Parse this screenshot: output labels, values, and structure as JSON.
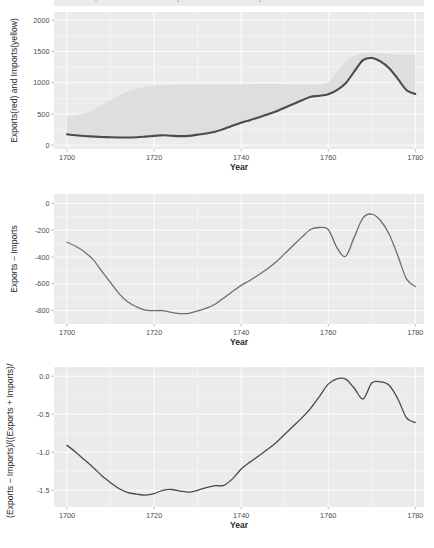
{
  "figure": {
    "width": 434,
    "height": 548,
    "background": "#ffffff",
    "panel_background": "#ebebeb",
    "gridline_color": "#ffffff",
    "tick_color": "#9a9a9a",
    "axis_text_color": "#4d4d4d",
    "axis_title_color": "#2b2b2b"
  },
  "shared": {
    "xlabel": "Year",
    "x_ticks": [
      1700,
      1720,
      1740,
      1760,
      1780
    ],
    "x_tick_labels": [
      "1700",
      "1720",
      "1740",
      "1760",
      "1780"
    ],
    "xlim": [
      1697,
      1782
    ]
  },
  "chart_data": [
    {
      "id": "panel-exports-imports-levels",
      "type": "area",
      "title": "",
      "xlabel": "Year",
      "ylabel": "Exports(red) and Imports(yellow)",
      "xlim": [
        1697,
        1782
      ],
      "ylim": [
        -60,
        2130
      ],
      "y_ticks": [
        0,
        500,
        1000,
        1500,
        2000
      ],
      "y_tick_labels": [
        "0",
        "500",
        "1000",
        "1500",
        "2000"
      ],
      "grid": true,
      "legend_position": "none",
      "x": [
        1700,
        1702,
        1704,
        1706,
        1708,
        1710,
        1712,
        1714,
        1716,
        1718,
        1720,
        1722,
        1724,
        1726,
        1728,
        1730,
        1732,
        1734,
        1736,
        1738,
        1740,
        1742,
        1744,
        1746,
        1748,
        1750,
        1752,
        1754,
        1756,
        1758,
        1760,
        1762,
        1764,
        1766,
        1768,
        1770,
        1772,
        1774,
        1776,
        1778,
        1780
      ],
      "series": [
        {
          "name": "Exports(red)",
          "color": "#4a4a4a",
          "values": [
            175,
            160,
            148,
            140,
            133,
            128,
            125,
            124,
            128,
            138,
            150,
            160,
            152,
            146,
            150,
            170,
            188,
            215,
            260,
            310,
            360,
            400,
            445,
            490,
            540,
            600,
            660,
            720,
            775,
            790,
            815,
            880,
            990,
            1180,
            1360,
            1395,
            1340,
            1230,
            1060,
            880,
            820
          ]
        },
        {
          "name": "Imports(yellow)",
          "color": "#dedede",
          "values": [
            465,
            480,
            510,
            560,
            640,
            720,
            800,
            860,
            900,
            935,
            950,
            960,
            965,
            968,
            970,
            972,
            970,
            968,
            966,
            968,
            972,
            975,
            978,
            980,
            978,
            975,
            972,
            970,
            968,
            970,
            1010,
            1180,
            1340,
            1430,
            1468,
            1475,
            1468,
            1460,
            1452,
            1445,
            1440
          ]
        }
      ],
      "ribbon": {
        "fill": "#dedede",
        "lower_series": "Exports(red)",
        "upper_series": "Imports(yellow)"
      }
    },
    {
      "id": "panel-trade-balance",
      "type": "line",
      "title": "",
      "xlabel": "Year",
      "ylabel": "Exports − Imports",
      "xlim": [
        1697,
        1782
      ],
      "ylim": [
        -900,
        70
      ],
      "y_ticks": [
        0,
        -200,
        -400,
        -600,
        -800
      ],
      "y_tick_labels": [
        "0",
        "-200",
        "-400",
        "-600",
        "-800"
      ],
      "grid": true,
      "legend_position": "none",
      "x": [
        1700,
        1702,
        1704,
        1706,
        1708,
        1710,
        1712,
        1714,
        1716,
        1718,
        1720,
        1722,
        1724,
        1726,
        1728,
        1730,
        1732,
        1734,
        1736,
        1738,
        1740,
        1742,
        1744,
        1746,
        1748,
        1750,
        1752,
        1754,
        1756,
        1758,
        1760,
        1762,
        1764,
        1766,
        1768,
        1770,
        1772,
        1774,
        1776,
        1778,
        1780
      ],
      "series": [
        {
          "name": "Exports − Imports",
          "color": "#6e6e6e",
          "values": [
            -290,
            -320,
            -362,
            -420,
            -507,
            -592,
            -675,
            -736,
            -772,
            -797,
            -800,
            -800,
            -813,
            -822,
            -820,
            -802,
            -782,
            -753,
            -706,
            -658,
            -612,
            -575,
            -533,
            -490,
            -438,
            -375,
            -312,
            -250,
            -193,
            -180,
            -195,
            -330,
            -395,
            -250,
            -108,
            -80,
            -128,
            -230,
            -392,
            -565,
            -620
          ]
        }
      ]
    },
    {
      "id": "panel-normalized-balance",
      "type": "line",
      "title": "",
      "xlabel": "Year",
      "ylabel": "(Exports − Imports)/((Exports + Imports)/2)",
      "xlim": [
        1697,
        1782
      ],
      "ylim": [
        -1.72,
        0.12
      ],
      "y_ticks": [
        0.0,
        -0.5,
        -1.0,
        -1.5
      ],
      "y_tick_labels": [
        "0.0",
        "-0.5",
        "-1.0",
        "-1.5"
      ],
      "grid": true,
      "legend_position": "none",
      "x": [
        1700,
        1702,
        1704,
        1706,
        1708,
        1710,
        1712,
        1714,
        1716,
        1718,
        1720,
        1722,
        1724,
        1726,
        1728,
        1730,
        1732,
        1734,
        1736,
        1738,
        1740,
        1742,
        1744,
        1746,
        1748,
        1750,
        1752,
        1754,
        1756,
        1758,
        1760,
        1762,
        1764,
        1766,
        1768,
        1770,
        1772,
        1774,
        1776,
        1778,
        1780
      ],
      "series": [
        {
          "name": "(Exports − Imports)/((Exports + Imports)/2)",
          "color": "#4a4a4a",
          "values": [
            -0.91,
            -1.0,
            -1.1,
            -1.2,
            -1.31,
            -1.4,
            -1.48,
            -1.53,
            -1.55,
            -1.565,
            -1.545,
            -1.5,
            -1.49,
            -1.51,
            -1.525,
            -1.5,
            -1.465,
            -1.44,
            -1.435,
            -1.35,
            -1.22,
            -1.13,
            -1.05,
            -0.965,
            -0.875,
            -0.765,
            -0.655,
            -0.545,
            -0.42,
            -0.265,
            -0.105,
            -0.035,
            -0.04,
            -0.16,
            -0.3,
            -0.09,
            -0.075,
            -0.12,
            -0.3,
            -0.55,
            -0.61
          ]
        }
      ]
    }
  ],
  "top_sliver": {
    "present": true,
    "description": "partial-previous-panel"
  }
}
